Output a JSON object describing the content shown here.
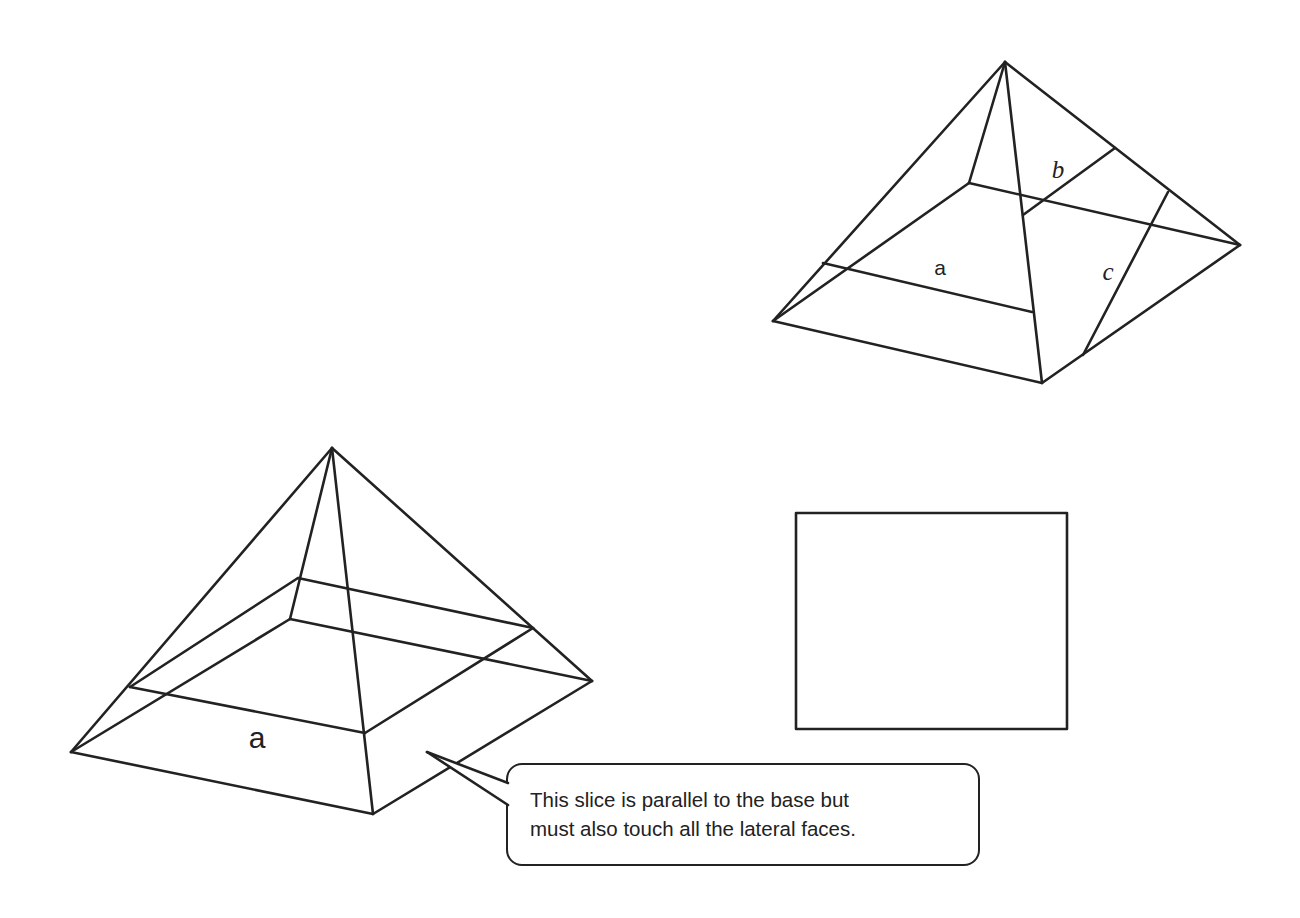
{
  "figure": {
    "background": "#ffffff",
    "stroke_color": "#222222"
  },
  "top_pyramid": {
    "vertices": {
      "apex": [
        1005,
        62
      ],
      "base_left": [
        773,
        321
      ],
      "base_front": [
        1042,
        383
      ],
      "base_right": [
        1240,
        245
      ],
      "base_back": [
        969,
        183
      ]
    },
    "slices": {
      "a": {
        "from": [
          823,
          263
        ],
        "to": [
          1032,
          312
        ]
      },
      "b": {
        "from": [
          1115,
          148
        ],
        "to": [
          1023,
          215
        ]
      },
      "c": {
        "from": [
          1168,
          192
        ],
        "to": [
          1083,
          355
        ]
      }
    },
    "labels": [
      {
        "id": "a",
        "text": "a",
        "x": 940,
        "y": 275,
        "style": "sans"
      },
      {
        "id": "b",
        "text": "b",
        "x": 1058,
        "y": 178,
        "style": "serif-italic"
      },
      {
        "id": "c",
        "text": "c",
        "x": 1108,
        "y": 280,
        "style": "serif-italic"
      }
    ]
  },
  "bottom_pyramid": {
    "vertices": {
      "apex": [
        332,
        448
      ],
      "base_left": [
        71,
        752
      ],
      "base_front": [
        373,
        814
      ],
      "base_right": [
        592,
        681
      ],
      "base_back": [
        290,
        619
      ]
    },
    "slice": {
      "left": [
        130,
        687
      ],
      "back": [
        298,
        578
      ],
      "right": [
        533,
        628
      ],
      "front": [
        365,
        733
      ]
    },
    "labels": [
      {
        "id": "a",
        "text": "a",
        "x": 257,
        "y": 748,
        "style": "sans"
      }
    ]
  },
  "cross_section_box": {
    "x": 796,
    "y": 513,
    "width": 271,
    "height": 216,
    "content": ""
  },
  "callout": {
    "lines": [
      "This slice is parallel to the base but",
      "must also touch all the lateral faces."
    ],
    "pointer_tip": [
      427,
      752
    ]
  }
}
